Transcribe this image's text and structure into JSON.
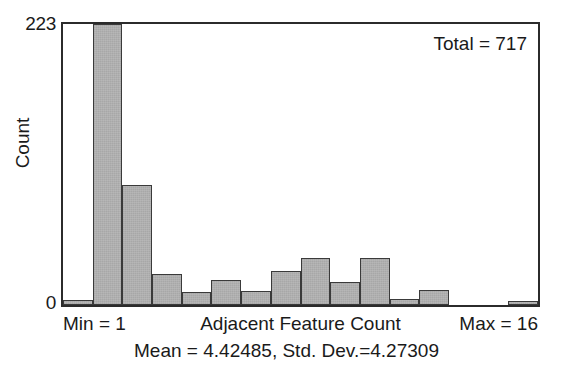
{
  "chart_data": {
    "type": "bar",
    "title": "",
    "xlabel": "Adjacent Feature Count",
    "ylabel": "Count",
    "ylim": [
      0,
      223
    ],
    "yticks": [
      0,
      223
    ],
    "ytick_labels": [
      "0",
      "223"
    ],
    "grid": false,
    "legend": null,
    "bin_count": 16,
    "categories": [
      "1",
      "2",
      "3",
      "4",
      "5",
      "6",
      "7",
      "8",
      "9",
      "10",
      "11",
      "12",
      "13",
      "14",
      "15",
      "16"
    ],
    "values": [
      4,
      223,
      95,
      25,
      10,
      20,
      11,
      27,
      37,
      18,
      37,
      5,
      12,
      0,
      0,
      3
    ],
    "annotations": {
      "total": "Total = 717",
      "min": "Min = 1",
      "max": "Max = 16",
      "stats": "Mean = 4.42485, Std. Dev.=4.27309"
    },
    "statistics": {
      "total": 717,
      "min": 1,
      "max": 16,
      "mean": 4.42485,
      "std_dev": 4.27309
    }
  },
  "axis": {
    "y_top_tick": "223",
    "y_bottom_tick": "0",
    "y_title": "Count",
    "x_title": "Adjacent Feature Count"
  },
  "labels": {
    "total": "Total = 717",
    "min": "Min = 1",
    "max": "Max = 16",
    "stats": "Mean = 4.42485, Std. Dev.=4.27309"
  },
  "colors": {
    "bar_fill": "#b3b3b3",
    "bar_stroke": "#3a3a3a",
    "frame": "#2b2b2b",
    "text": "#1a1a1a",
    "background": "#ffffff"
  }
}
